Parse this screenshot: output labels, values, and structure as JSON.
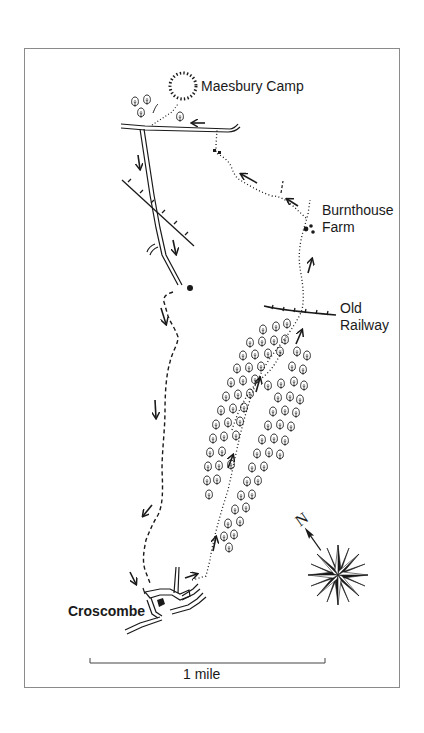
{
  "map": {
    "title": "Maesbury Camp to Croscombe circular walk",
    "places": [
      {
        "id": "maesbury-camp",
        "lines": [
          "Maesbury Camp"
        ],
        "x": 201,
        "y": 78,
        "bold": false
      },
      {
        "id": "burnthouse-farm",
        "lines": [
          "Burnthouse",
          "Farm"
        ],
        "x": 322,
        "y": 204,
        "bold": false
      },
      {
        "id": "old-railway",
        "lines": [
          "Old",
          "Railway"
        ],
        "x": 340,
        "y": 302,
        "bold": false
      },
      {
        "id": "croscombe",
        "lines": [
          "Croscombe"
        ],
        "x": 68,
        "y": 604,
        "bold": true
      }
    ],
    "labels": {
      "maesbury_camp": "Maesbury Camp",
      "burnthouse_1": "Burnthouse",
      "burnthouse_2": "Farm",
      "old_railway_1": "Old",
      "old_railway_2": "Railway",
      "croscombe": "Croscombe"
    },
    "scale": {
      "label": "1 mile",
      "x1": 90,
      "x2": 325,
      "y": 663
    },
    "compass": {
      "label": "N",
      "cx": 338,
      "cy": 575,
      "radius": 30
    },
    "colors": {
      "ink": "#1a1a1a",
      "frame": "#8a8a8a",
      "background": "#ffffff"
    }
  }
}
